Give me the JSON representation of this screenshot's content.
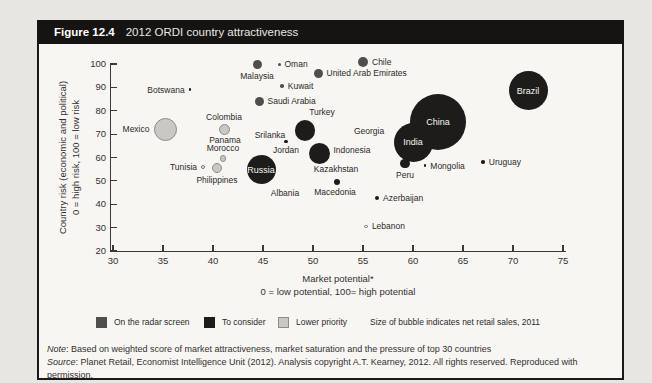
{
  "figure": {
    "label": "Figure 12.4",
    "title": "2012 ORDI country attractiveness"
  },
  "colors": {
    "page_bg": "#e8e6e2",
    "box_bg": "#f7f6f3",
    "bar_bg": "#161412",
    "radar": "#4f4e4c",
    "consider": "#1d1c1a",
    "lower_fill": "#cac8c4",
    "lower_stroke": "#8e8d8a",
    "open_fill": "#faf9f7",
    "open_stroke": "#6f6e6c"
  },
  "axes": {
    "x": {
      "title": "Market potential*",
      "subtitle": "0 = low potential, 100= high potential",
      "min": 30,
      "max": 75,
      "ticks": [
        30,
        35,
        40,
        45,
        50,
        55,
        60,
        65,
        70,
        75
      ]
    },
    "y": {
      "title": "Country risk (economic and political)",
      "subtitle": "0 = high risk, 100 = low risk",
      "min": 20,
      "max": 100,
      "ticks": [
        20,
        30,
        40,
        50,
        60,
        70,
        80,
        90,
        100
      ]
    }
  },
  "legend": {
    "items": [
      {
        "label": "On the radar screen",
        "category": "radar"
      },
      {
        "label": "To consider",
        "category": "consider"
      },
      {
        "label": "Lower priority",
        "category": "lower"
      }
    ],
    "size_note": "Size of bubble indicates net retail sales, 2011"
  },
  "notes": {
    "note_label": "Note",
    "note_body": ": Based on weighted score of market attractiveness, market saturation and the pressure of top 30 countries",
    "source_label": "Source",
    "source_body": ": Planet Retail, Economist Intelligence Unit (2012). Analysis copyright A.T. Kearney, 2012. All rights reserved. Reproduced with permission."
  },
  "chart_data": {
    "type": "scatter",
    "subtype": "bubble",
    "title": "2012 ORDI country attractiveness",
    "xlabel": "Market potential* (0 = low potential, 100= high potential)",
    "ylabel": "Country risk (economic and political) (0 = high risk, 100 = low risk)",
    "xlim": [
      30,
      75
    ],
    "ylim": [
      20,
      100
    ],
    "grid": false,
    "size_meaning": "net retail sales, 2011",
    "points": [
      {
        "name": "Mexico",
        "x": 35.2,
        "y": 72,
        "r": 11.5,
        "category": "lower",
        "marker": true,
        "anchor": "left"
      },
      {
        "name": "Colombia",
        "x": 41.1,
        "y": 72,
        "r": 5.5,
        "category": "lower",
        "marker": true,
        "anchor": "above"
      },
      {
        "name": "Philippines",
        "x": 40.4,
        "y": 55.5,
        "r": 5,
        "category": "lower",
        "marker": true,
        "anchor": "below"
      },
      {
        "name": "Morocco",
        "x": 41.0,
        "y": 59.5,
        "r": 3.2,
        "category": "lower",
        "marker": true,
        "anchor": "above"
      },
      {
        "name": "Panama",
        "x": 41.2,
        "y": 67.5,
        "r": 0,
        "category": "lower",
        "marker": false,
        "anchor": "center"
      },
      {
        "name": "Tunisia",
        "x": 39.0,
        "y": 56,
        "r": 2,
        "category": "open",
        "marker": true,
        "anchor": "left"
      },
      {
        "name": "Botswana",
        "x": 37.7,
        "y": 89,
        "r": 1.3,
        "category": "consider",
        "marker": true,
        "anchor": "left"
      },
      {
        "name": "Malaysia",
        "x": 44.4,
        "y": 100,
        "r": 4.5,
        "category": "radar",
        "marker": true,
        "anchor": "below"
      },
      {
        "name": "Oman",
        "x": 46.6,
        "y": 100,
        "r": 1.5,
        "category": "radar",
        "marker": true,
        "anchor": "right"
      },
      {
        "name": "Chile",
        "x": 55.0,
        "y": 101,
        "r": 5,
        "category": "radar",
        "marker": true,
        "anchor": "right"
      },
      {
        "name": "United Arab Emirates",
        "x": 50.5,
        "y": 96,
        "r": 4.5,
        "category": "radar",
        "marker": true,
        "anchor": "right"
      },
      {
        "name": "Kuwait",
        "x": 46.9,
        "y": 90.5,
        "r": 1.8,
        "category": "radar",
        "marker": true,
        "anchor": "right"
      },
      {
        "name": "Saudi Arabia",
        "x": 44.6,
        "y": 84,
        "r": 4.5,
        "category": "radar",
        "marker": true,
        "anchor": "right"
      },
      {
        "name": "Srilanka",
        "x": 45.7,
        "y": 69.5,
        "r": 0,
        "category": "consider",
        "marker": false,
        "anchor": "center"
      },
      {
        "name": "Jordan",
        "x": 47.3,
        "y": 67,
        "r": 1.6,
        "category": "consider",
        "marker": true,
        "anchor": "below"
      },
      {
        "name": "Turkey",
        "x": 49.2,
        "y": 71.5,
        "r": 10.3,
        "category": "consider",
        "marker": true,
        "anchor": "above",
        "dx": 17,
        "dy": -1
      },
      {
        "name": "Russia",
        "x": 44.8,
        "y": 54.8,
        "r": 14.5,
        "category": "consider",
        "marker": true,
        "anchor": "inside"
      },
      {
        "name": "Indonesia",
        "x": 50.6,
        "y": 61.5,
        "r": 10.5,
        "category": "consider",
        "marker": true,
        "anchor": "right",
        "dy": -4
      },
      {
        "name": "Georgia",
        "x": 55.6,
        "y": 71.5,
        "r": 0,
        "category": "consider",
        "marker": false,
        "anchor": "center"
      },
      {
        "name": "Kazakhstan",
        "x": 52.3,
        "y": 55,
        "r": 0,
        "category": "consider",
        "marker": false,
        "anchor": "center"
      },
      {
        "name": "Macedonia",
        "x": 52.4,
        "y": 49.5,
        "r": 3,
        "category": "consider",
        "marker": true,
        "anchor": "below",
        "dx": -2
      },
      {
        "name": "Albania",
        "x": 47.2,
        "y": 45,
        "r": 0,
        "category": "consider",
        "marker": false,
        "anchor": "center"
      },
      {
        "name": "Azerbaijan",
        "x": 56.4,
        "y": 42.5,
        "r": 2,
        "category": "consider",
        "marker": true,
        "anchor": "right"
      },
      {
        "name": "Lebanon",
        "x": 55.3,
        "y": 30.5,
        "r": 1.9,
        "category": "open",
        "marker": true,
        "anchor": "right"
      },
      {
        "name": "China",
        "x": 62.5,
        "y": 75,
        "r": 28,
        "category": "consider",
        "marker": true,
        "anchor": "inside"
      },
      {
        "name": "India",
        "x": 60.0,
        "y": 66.5,
        "r": 19.5,
        "category": "consider",
        "marker": true,
        "anchor": "inside"
      },
      {
        "name": "Peru",
        "x": 59.2,
        "y": 57.5,
        "r": 4.8,
        "category": "consider",
        "marker": true,
        "anchor": "below"
      },
      {
        "name": "Mongolia",
        "x": 61.2,
        "y": 56.5,
        "r": 1.3,
        "category": "consider",
        "marker": true,
        "anchor": "right"
      },
      {
        "name": "Uruguay",
        "x": 67.0,
        "y": 58,
        "r": 1.8,
        "category": "consider",
        "marker": true,
        "anchor": "right"
      },
      {
        "name": "Brazil",
        "x": 71.5,
        "y": 88.5,
        "r": 19.5,
        "category": "consider",
        "marker": true,
        "anchor": "inside"
      }
    ]
  }
}
